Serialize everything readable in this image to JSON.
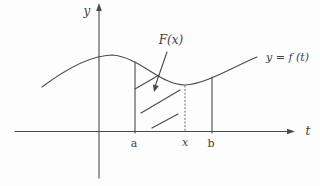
{
  "figure": {
    "type": "calculus-accumulation-area-diagram",
    "background": "#fdfdfd",
    "line_color": "#4a4a4a",
    "labels": {
      "y_axis": "y",
      "t_axis": "t",
      "curve": "y = f (t)",
      "region": "F(x)",
      "point_a": "a",
      "point_x": "x",
      "point_b": "b"
    }
  }
}
